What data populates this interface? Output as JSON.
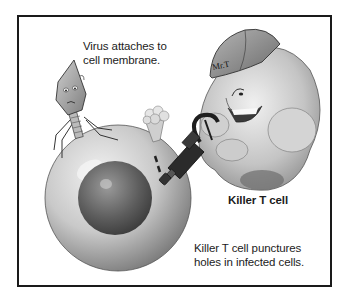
{
  "figure": {
    "characters": {
      "virus": {
        "name": "virus",
        "description": "bacteriophage-style virus with worried face"
      },
      "t_cell": {
        "name": "Killer T cell",
        "helmet_text": "Mr.T",
        "tool": "drill"
      },
      "infected_cell": {
        "name": "infected cell",
        "parts": [
          "membrane",
          "nucleus"
        ]
      }
    },
    "labels": {
      "virus_caption_line1": "Virus attaches to",
      "virus_caption_line2": "cell membrane.",
      "tcell_title": "Killer T cell",
      "tcell_caption_line1": "Killer T cell punctures",
      "tcell_caption_line2": "holes in infected cells."
    },
    "colors": {
      "frame": "#1a1a1a",
      "background": "#ffffff",
      "cell_light": "#d9d9d9",
      "cell_dark": "#6e6e6e",
      "nucleus": "#555555",
      "tcell_body": "#c8c8c8",
      "drill": "#2a2a2a"
    }
  }
}
